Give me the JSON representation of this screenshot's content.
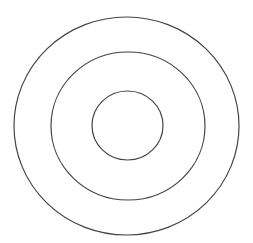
{
  "diagram": {
    "type": "concentric-circles",
    "stroke_color": "#444444",
    "background": "#ffffff",
    "circles": [
      {
        "name": "outer-circle",
        "cx": 126.5,
        "cy": 126,
        "rx": 112.5,
        "ry": 109
      },
      {
        "name": "middle-circle",
        "cx": 128,
        "cy": 126,
        "rx": 77,
        "ry": 74
      },
      {
        "name": "inner-circle",
        "cx": 127.5,
        "cy": 125.5,
        "rx": 35.5,
        "ry": 34.5
      }
    ]
  }
}
